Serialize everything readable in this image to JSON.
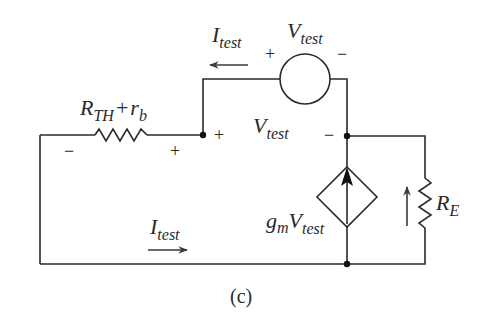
{
  "figure": {
    "caption": "(c)",
    "colors": {
      "ink": "#2a2a2a",
      "background": "#ffffff"
    }
  },
  "components": {
    "series_resistor": {
      "label_main": "R",
      "label_sub": "TH",
      "label_plus": "+",
      "label_r": "r",
      "label_r_sub": "b",
      "polarity_left": "−",
      "polarity_right": "+"
    },
    "test_source": {
      "label_main": "V",
      "label_sub": "test",
      "polarity_left": "+",
      "polarity_right": "−"
    },
    "node_voltage": {
      "label_main": "V",
      "label_sub": "test",
      "polarity_left": "+",
      "polarity_right": "−"
    },
    "dependent_source": {
      "label_g": "g",
      "label_g_sub": "m",
      "label_main": "V",
      "label_sub": "test"
    },
    "emitter_resistor": {
      "label_main": "R",
      "label_sub": "E"
    }
  },
  "currents": {
    "top": {
      "label_main": "I",
      "label_sub": "test",
      "direction": "left"
    },
    "bottom": {
      "label_main": "I",
      "label_sub": "test",
      "direction": "right"
    }
  }
}
